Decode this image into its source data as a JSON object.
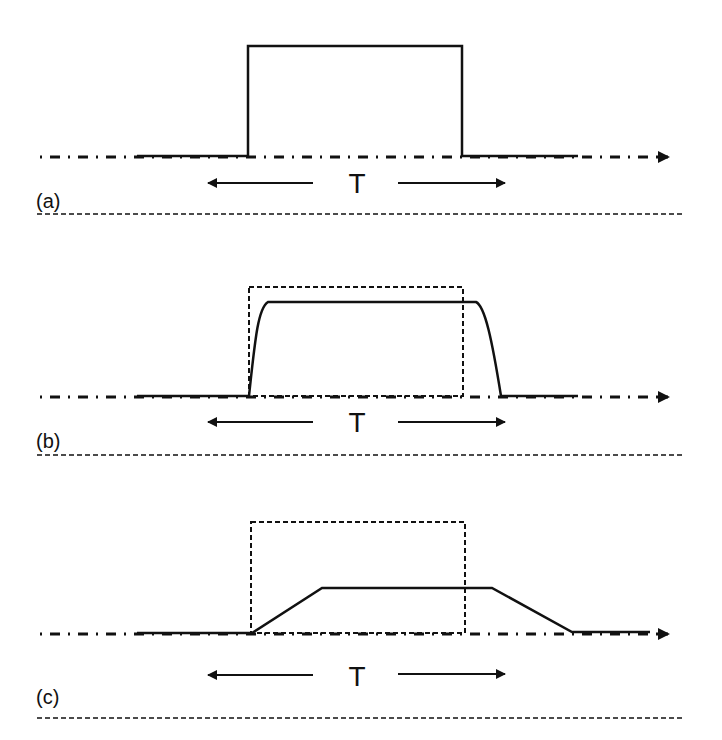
{
  "figure": {
    "colors": {
      "stroke": "#111111",
      "background": "#ffffff"
    }
  },
  "panels": [
    {
      "id": "a",
      "label": "(a)",
      "duration_label": "T",
      "axis_y": 156,
      "pulse_shape": "ideal rectangle",
      "pulse_points": "137,156 248,156 248,46 462,46 462,156 578,156",
      "reference_rect": null,
      "label_y": 208,
      "arrow_y": 183,
      "t_y": 193,
      "separator_y": 214
    },
    {
      "id": "b",
      "label": "(b)",
      "duration_label": "T",
      "axis_y": 396,
      "pulse_shape": "slightly rounded edges",
      "pulse_path": "M137,396 L249,396 C255,340 258,308 268,302 L476,302 C485,306 492,340 501,396 L578,396",
      "reference_rect": {
        "x": 249,
        "y": 287,
        "width": 214,
        "height": 109
      },
      "label_y": 448,
      "arrow_y": 422,
      "t_y": 432,
      "separator_y": 455
    },
    {
      "id": "c",
      "label": "(c)",
      "duration_label": "T",
      "axis_y": 633,
      "pulse_shape": "trapezoid (slow rise/fall)",
      "pulse_path": "M137,633 L252,633 L322,588 L492,588 L572,632 L650,632",
      "reference_rect": {
        "x": 251,
        "y": 522,
        "width": 214,
        "height": 111
      },
      "label_y": 692,
      "arrow_y": 675,
      "t_y": 686,
      "separator_y": 718
    }
  ]
}
